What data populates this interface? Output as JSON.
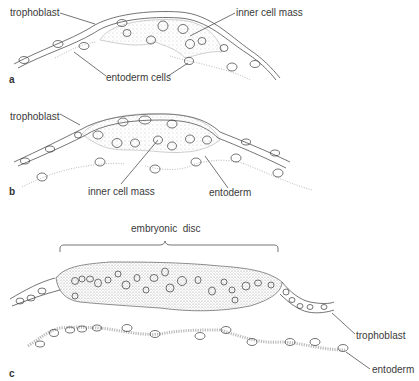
{
  "panels": [
    {
      "id": "a",
      "letter": "a",
      "labels": {
        "trophoblast": "trophoblast",
        "inner_cell_mass": "inner cell mass",
        "entoderm": "entoderm cells"
      }
    },
    {
      "id": "b",
      "letter": "b",
      "labels": {
        "trophoblast": "trophoblast",
        "inner_cell_mass": "inner cell mass",
        "entoderm": "entoderm"
      }
    },
    {
      "id": "c",
      "letter": "c",
      "labels": {
        "embryonic_disc": "embryonic  disc",
        "trophoblast": "trophoblast",
        "entoderm": "entoderm"
      }
    }
  ],
  "colors": {
    "ink": "#3a3a3a",
    "stipple": "#9a9a9a",
    "background": "#ffffff"
  }
}
